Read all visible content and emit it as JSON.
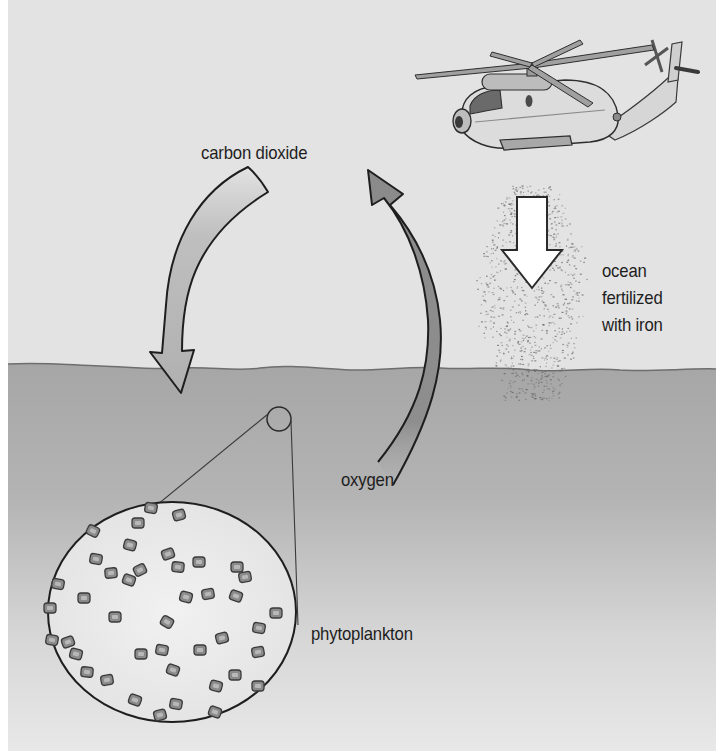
{
  "diagram": {
    "labels": {
      "carbon_dioxide": "carbon dioxide",
      "oxygen": "oxygen",
      "phytoplankton": "phytoplankton",
      "ocean_fertilized": [
        "ocean",
        "fertilized",
        "with iron"
      ]
    },
    "elements": {
      "helicopter": "helicopter dropping iron",
      "iron_particles": "iron particle cloud",
      "down_arrow": "white arrow pointing down into ocean",
      "co2_arrow": "arrow from air down into ocean (carbon dioxide absorbed)",
      "o2_arrow": "arrow from ocean up into air (oxygen released)",
      "magnifier": "magnified circle of phytoplankton",
      "ocean_surface": "ocean surface line"
    },
    "colors": {
      "sky": "#e4e4e4",
      "ocean": "#a9a9a9",
      "ocean_deep_fade": "#e6e6e6",
      "co2_arrow": "#b8b8b8",
      "o2_arrow": "#8d8d8d",
      "magnifier_fill": "#ececec",
      "outline": "#1e1e1e"
    }
  }
}
